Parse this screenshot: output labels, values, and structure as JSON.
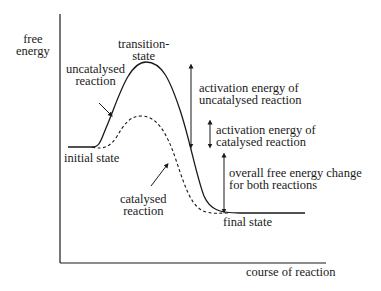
{
  "diagram": {
    "type": "energy-profile",
    "y_axis_label": [
      "free",
      "energy"
    ],
    "x_axis_label": "course of reaction",
    "labels": {
      "transition_state": [
        "transition-",
        "state"
      ],
      "uncatalysed": [
        "uncatalysed",
        "reaction"
      ],
      "catalysed": [
        "catalysed",
        "reaction"
      ],
      "initial_state": "initial state",
      "final_state": "final state",
      "activation_uncatalysed": [
        "activation energy of",
        "uncatalysed reaction"
      ],
      "activation_catalysed": [
        "activation energy of",
        "catalysed reaction"
      ],
      "overall_change": [
        "overall free energy change",
        "for both reactions"
      ]
    },
    "curves": [
      {
        "name": "uncatalysed reaction",
        "style": "solid"
      },
      {
        "name": "catalysed reaction",
        "style": "dashed"
      }
    ],
    "colors": {
      "ink": "#1a1a1a",
      "background": "#ffffff"
    }
  }
}
